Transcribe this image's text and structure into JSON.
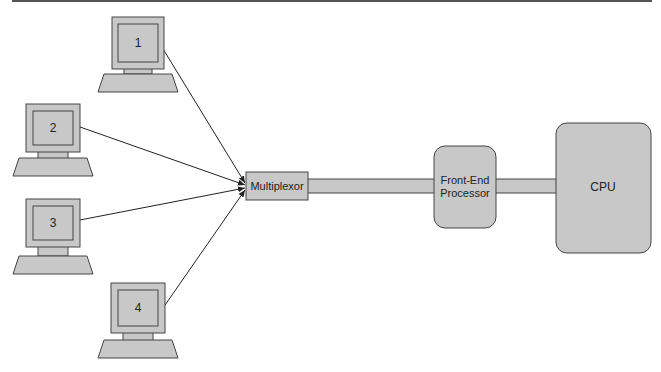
{
  "diagram": {
    "terminals": [
      {
        "id": "1",
        "label": "1"
      },
      {
        "id": "2",
        "label": "2"
      },
      {
        "id": "3",
        "label": "3"
      },
      {
        "id": "4",
        "label": "4"
      }
    ],
    "multiplexor": {
      "label": "Multiplexor"
    },
    "front_end_processor": {
      "line1": "Front-End",
      "line2": "Processor"
    },
    "cpu": {
      "label": "CPU"
    },
    "colors": {
      "fill": "#c8c8c8",
      "stroke": "#444444",
      "line": "#222222"
    }
  }
}
